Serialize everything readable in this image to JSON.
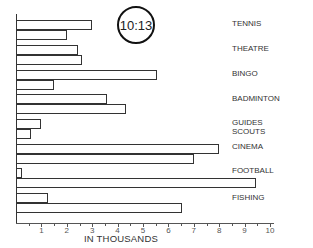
{
  "clock": {
    "time": "10:13"
  },
  "chart_data": {
    "type": "bar",
    "orientation": "horizontal",
    "title": "",
    "xlabel": "IN THOUSANDS",
    "ylabel": "",
    "xlim": [
      0,
      10
    ],
    "x_ticks": [
      "1",
      "2",
      "3",
      "4",
      "5",
      "6",
      "7",
      "8",
      "9",
      "10"
    ],
    "grid": false,
    "legend": null,
    "categories": [
      "TENNIS",
      "THEATRE",
      "BINGO",
      "BADMINTON",
      "GUIDES SCOUTS",
      "CINEMA",
      "FOOTBALL",
      "FISHING"
    ],
    "series": [
      {
        "name": "bar 1 (upper)",
        "values": [
          3.0,
          2.45,
          5.55,
          3.6,
          1.0,
          8.0,
          0.25,
          1.25
        ]
      },
      {
        "name": "bar 2 (lower)",
        "values": [
          2.0,
          2.6,
          1.5,
          4.35,
          0.6,
          7.0,
          9.45,
          6.55
        ]
      }
    ]
  },
  "labels": {
    "tennis": "TENNIS",
    "theatre": "THEATRE",
    "bingo": "BINGO",
    "badminton": "BADMINTON",
    "guides": "GUIDES",
    "scouts": "SCOUTS",
    "cinema": "CINEMA",
    "football": "FOOTBALL",
    "fishing": "FISHING"
  },
  "axis": {
    "xlabel": "IN THOUSANDS",
    "ticks": [
      "1",
      "2",
      "3",
      "4",
      "5",
      "6",
      "7",
      "8",
      "9",
      "10"
    ]
  }
}
